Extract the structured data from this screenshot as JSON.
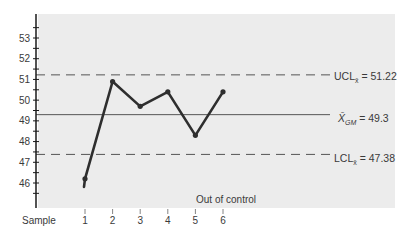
{
  "chart_data": {
    "type": "line",
    "title": "",
    "xlabel": "Sample",
    "ylabel": "",
    "categories": [
      "1",
      "2",
      "3",
      "4",
      "5",
      "6"
    ],
    "x": [
      1,
      2,
      3,
      4,
      5,
      6
    ],
    "values": [
      46.2,
      50.9,
      49.7,
      50.4,
      48.3,
      50.4
    ],
    "series": [
      {
        "name": "Sample mean",
        "values": [
          46.2,
          50.9,
          49.7,
          50.4,
          48.3,
          50.4
        ]
      }
    ],
    "ylim": [
      45,
      54
    ],
    "yticks": [
      46,
      47,
      48,
      49,
      50,
      51,
      52,
      53
    ],
    "grid": false,
    "reference_lines": [
      {
        "name": "UCL",
        "label_main": "UCL",
        "label_sub": "x̄",
        "label_value": " = 51.22",
        "value": 51.22,
        "style": "dashed"
      },
      {
        "name": "Grand mean",
        "label_main": "X̄",
        "label_sub": "GM",
        "label_value": " = 49.3",
        "value": 49.3,
        "style": "solid"
      },
      {
        "name": "LCL",
        "label_main": "LCL",
        "label_sub": "x̄",
        "label_value": " = 47.38",
        "value": 47.38,
        "style": "dashed"
      }
    ],
    "annotations": [
      {
        "text": "Out of control",
        "target_sample": 1
      }
    ]
  },
  "labels": {
    "x_axis": "Sample",
    "annotation": "Out of control",
    "ucl_main": "UCL",
    "ucl_sub": "x̄",
    "ucl_value": " = 51.22",
    "cl_main": "X̄",
    "cl_sub": "GM",
    "cl_value": " = 49.3",
    "lcl_main": "LCL",
    "lcl_sub": "x̄",
    "lcl_value": " = 47.38"
  },
  "colors": {
    "plot_bg": "#ececec",
    "line": "#2e2e2e",
    "axis": "#1a1a1a",
    "text": "#3a3a3a"
  }
}
